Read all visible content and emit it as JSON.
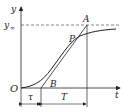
{
  "labels": {
    "y_axis": "y",
    "y_inf_main": "y",
    "y_inf_sub": "∞",
    "x_axis": "t",
    "origin": "O",
    "point_a": "A",
    "point_p": "P",
    "point_b": "B",
    "tau": "τ",
    "T": "T"
  },
  "colors": {
    "line": "#222222",
    "dash": "#555555"
  }
}
